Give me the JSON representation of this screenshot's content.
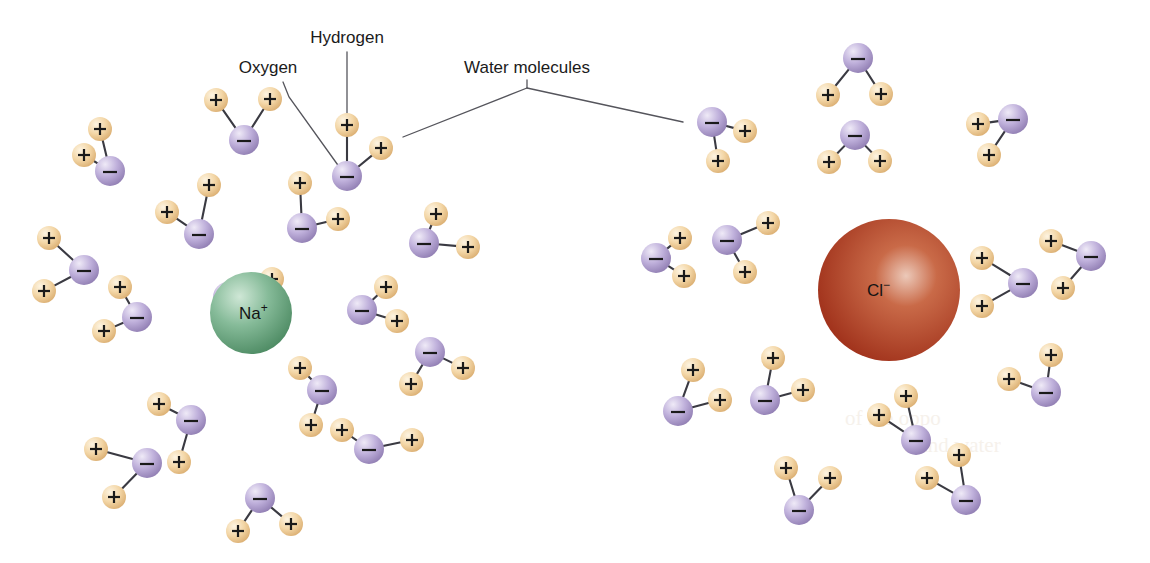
{
  "figure": {
    "type": "molecular-diagram",
    "background": "#ffffff",
    "width": 1150,
    "height": 563
  },
  "labels": [
    {
      "id": "hydrogen",
      "text": "Hydrogen",
      "x": 347,
      "y": 43,
      "anchor": "middle"
    },
    {
      "id": "oxygen",
      "text": "Oxygen",
      "x": 268,
      "y": 73,
      "anchor": "middle"
    },
    {
      "id": "water",
      "text": "Water molecules",
      "x": 527,
      "y": 73,
      "anchor": "middle"
    }
  ],
  "leaders": [
    {
      "id": "hydrogen-leader",
      "points": "347,52 347,125"
    },
    {
      "id": "oxygen-leader",
      "points": "283,82 289,97 340,168"
    },
    {
      "id": "water-leader-stem",
      "points": "527,80 527,88"
    },
    {
      "id": "water-leader-left",
      "points": "527,88 403,137"
    },
    {
      "id": "water-leader-right",
      "points": "527,88 683,122"
    }
  ],
  "ions": [
    {
      "id": "sodium",
      "symbol": "Na",
      "charge": "+",
      "cx": 251,
      "cy": 313,
      "r": 41,
      "color_light": "#c9e2d0",
      "color_mid": "#79b48f",
      "color_dark": "#4d8f68",
      "label_dx": -12,
      "label_dy": 6
    },
    {
      "id": "chloride",
      "symbol": "Cl",
      "charge": "−",
      "cx": 889,
      "cy": 290,
      "r": 71,
      "color_light": "#e8c2b2",
      "color_mid": "#bf5334",
      "color_dark": "#9c2a16",
      "label_dx": -22,
      "label_dy": 6
    }
  ],
  "atom_style": {
    "oxygen_radius": 15,
    "oxygen_light": "#e6e0f2",
    "oxygen_mid": "#b7a8d4",
    "oxygen_dark": "#8d7ab0",
    "oxygen_sign": "−",
    "hydrogen_radius": 12,
    "hydrogen_light": "#fdf0d8",
    "hydrogen_mid": "#f0cf9a",
    "hydrogen_dark": "#d9ab6a",
    "hydrogen_sign": "+",
    "bond_color": "#3a3a42"
  },
  "water_molecules": [
    {
      "id": "w01",
      "ox": 244,
      "oy": 140,
      "h": [
        [
          216,
          100
        ],
        [
          270,
          99
        ]
      ]
    },
    {
      "id": "w02",
      "ox": 347,
      "oy": 176,
      "h": [
        [
          347,
          125
        ],
        [
          381,
          148
        ]
      ]
    },
    {
      "id": "w03",
      "ox": 110,
      "oy": 171,
      "h": [
        [
          84,
          155
        ],
        [
          100,
          129
        ]
      ]
    },
    {
      "id": "w04",
      "ox": 199,
      "oy": 234,
      "h": [
        [
          167,
          212
        ],
        [
          209,
          185
        ]
      ]
    },
    {
      "id": "w05",
      "ox": 302,
      "oy": 228,
      "h": [
        [
          300,
          183
        ],
        [
          338,
          219
        ]
      ]
    },
    {
      "id": "w06",
      "ox": 84,
      "oy": 270,
      "h": [
        [
          49,
          238
        ],
        [
          44,
          291
        ]
      ]
    },
    {
      "id": "w07",
      "ox": 137,
      "oy": 317,
      "h": [
        [
          120,
          287
        ],
        [
          104,
          331
        ]
      ]
    },
    {
      "id": "w08",
      "ox": 228,
      "oy": 297,
      "h": [
        [
          272,
          279
        ],
        [
          272,
          312
        ]
      ]
    },
    {
      "id": "w09",
      "ox": 362,
      "oy": 310,
      "h": [
        [
          386,
          287
        ],
        [
          397,
          321
        ]
      ]
    },
    {
      "id": "w10",
      "ox": 424,
      "oy": 243,
      "h": [
        [
          436,
          214
        ],
        [
          468,
          247
        ]
      ]
    },
    {
      "id": "w11",
      "ox": 430,
      "oy": 352,
      "h": [
        [
          411,
          384
        ],
        [
          463,
          368
        ]
      ]
    },
    {
      "id": "w12",
      "ox": 322,
      "oy": 390,
      "h": [
        [
          300,
          368
        ],
        [
          311,
          425
        ]
      ]
    },
    {
      "id": "w13",
      "ox": 191,
      "oy": 420,
      "h": [
        [
          159,
          404
        ],
        [
          179,
          462
        ]
      ]
    },
    {
      "id": "w14",
      "ox": 147,
      "oy": 463,
      "h": [
        [
          96,
          449
        ],
        [
          114,
          497
        ]
      ]
    },
    {
      "id": "w15",
      "ox": 260,
      "oy": 498,
      "h": [
        [
          238,
          531
        ],
        [
          291,
          524
        ]
      ]
    },
    {
      "id": "w16",
      "ox": 369,
      "oy": 449,
      "h": [
        [
          342,
          430
        ],
        [
          412,
          440
        ]
      ]
    },
    {
      "id": "w17",
      "ox": 712,
      "oy": 122,
      "h": [
        [
          745,
          131
        ],
        [
          718,
          161
        ]
      ]
    },
    {
      "id": "w18",
      "ox": 858,
      "oy": 58,
      "h": [
        [
          828,
          95
        ],
        [
          881,
          94
        ]
      ]
    },
    {
      "id": "w19",
      "ox": 855,
      "oy": 135,
      "h": [
        [
          829,
          162
        ],
        [
          880,
          161
        ]
      ]
    },
    {
      "id": "w20",
      "ox": 1013,
      "oy": 119,
      "h": [
        [
          978,
          124
        ],
        [
          989,
          155
        ]
      ]
    },
    {
      "id": "w21",
      "ox": 656,
      "oy": 258,
      "h": [
        [
          680,
          238
        ],
        [
          684,
          276
        ]
      ]
    },
    {
      "id": "w22",
      "ox": 727,
      "oy": 240,
      "h": [
        [
          768,
          223
        ],
        [
          745,
          272
        ]
      ]
    },
    {
      "id": "w23",
      "ox": 1023,
      "oy": 283,
      "h": [
        [
          982,
          258
        ],
        [
          982,
          306
        ]
      ]
    },
    {
      "id": "w24",
      "ox": 1091,
      "oy": 256,
      "h": [
        [
          1051,
          241
        ],
        [
          1063,
          288
        ]
      ]
    },
    {
      "id": "w25",
      "ox": 1046,
      "oy": 392,
      "h": [
        [
          1009,
          379
        ],
        [
          1051,
          355
        ]
      ]
    },
    {
      "id": "w26",
      "ox": 678,
      "oy": 411,
      "h": [
        [
          693,
          370
        ],
        [
          720,
          400
        ]
      ]
    },
    {
      "id": "w27",
      "ox": 765,
      "oy": 400,
      "h": [
        [
          773,
          358
        ],
        [
          803,
          390
        ]
      ]
    },
    {
      "id": "w28",
      "ox": 799,
      "oy": 510,
      "h": [
        [
          786,
          468
        ],
        [
          830,
          478
        ]
      ]
    },
    {
      "id": "w29",
      "ox": 916,
      "oy": 440,
      "h": [
        [
          906,
          396
        ],
        [
          879,
          415
        ]
      ]
    },
    {
      "id": "w30",
      "ox": 966,
      "oy": 500,
      "h": [
        [
          927,
          478
        ],
        [
          959,
          455
        ]
      ]
    }
  ],
  "artifacts": {
    "note": "faint print bleed-through visible in lower-right area",
    "ghost_text": [
      {
        "text": "of the oppo",
        "x": 845,
        "y": 425
      },
      {
        "text": "s and water",
        "x": 905,
        "y": 452
      }
    ]
  }
}
